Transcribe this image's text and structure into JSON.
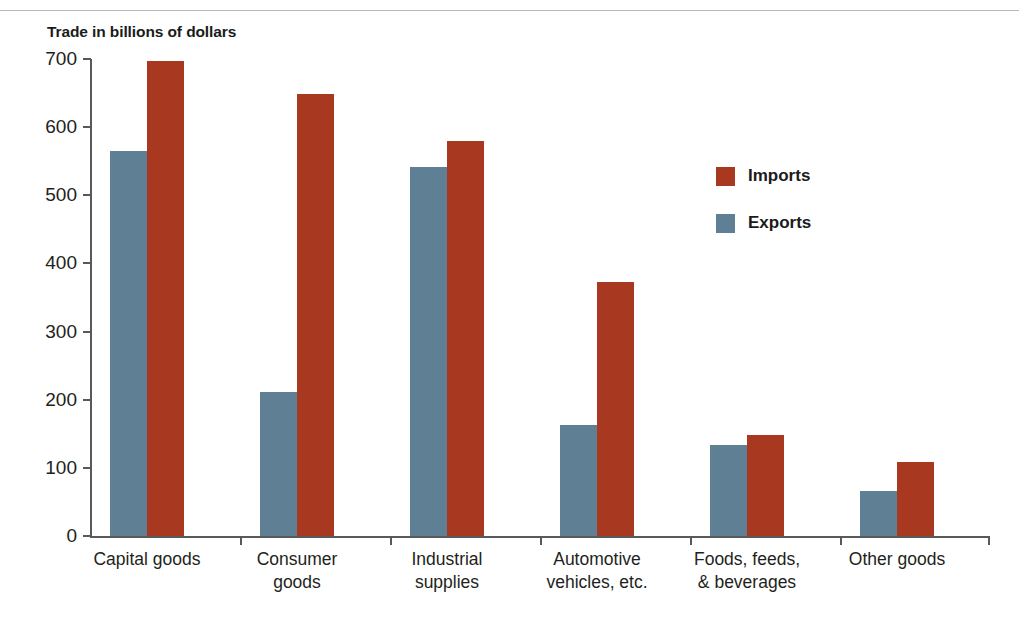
{
  "chart_data": {
    "type": "bar",
    "title": "Trade in billions of dollars",
    "xlabel": "",
    "ylabel": "Trade in billions of dollars",
    "ylim": [
      0,
      700
    ],
    "yticks": [
      0,
      100,
      200,
      300,
      400,
      500,
      600,
      700
    ],
    "ytick_labels": [
      "0",
      "100",
      "200",
      "300",
      "400",
      "500",
      "600",
      "700"
    ],
    "grid": false,
    "legend_position": "inside-right",
    "categories": [
      "Capital goods",
      "Consumer\ngoods",
      "Industrial\nsupplies",
      "Automotive\nvehicles, etc.",
      "Foods, feeds,\n& beverages",
      "Other goods"
    ],
    "series": [
      {
        "name": "Exports",
        "color": "#5f7f94",
        "values": [
          565,
          211,
          542,
          163,
          133,
          66
        ]
      },
      {
        "name": "Imports",
        "color": "#a8381f",
        "values": [
          697,
          649,
          580,
          373,
          148,
          109
        ]
      }
    ]
  },
  "legend": {
    "entries": [
      {
        "label": "Imports",
        "color": "#a8381f",
        "swatch": "imports-swatch"
      },
      {
        "label": "Exports",
        "color": "#5f7f94",
        "swatch": "exports-swatch"
      }
    ]
  },
  "colors": {
    "imports": "#a8381f",
    "exports": "#5f7f94",
    "axis": "#58595b",
    "text": "#231f20",
    "rule": "#b9bcbe",
    "background": "#ffffff"
  }
}
